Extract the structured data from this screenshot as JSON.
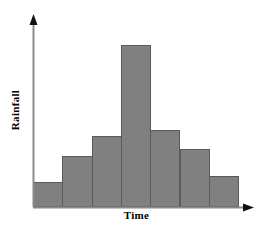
{
  "chart_data": {
    "type": "bar",
    "title": "",
    "subtitle": "",
    "xlabel": "Time",
    "ylabel": "Rainfall",
    "categories": [
      "1",
      "2",
      "3",
      "4",
      "5",
      "6",
      "7"
    ],
    "values": [
      26,
      52,
      73,
      166,
      79,
      60,
      32
    ],
    "ylim": [
      0,
      192
    ],
    "xlim": [
      0,
      7
    ],
    "grid": false,
    "legend": null,
    "legend_position": "none",
    "axis_ticks_x": [],
    "axis_ticks_y": [],
    "annotations": [],
    "bar_fill_color": "#808080",
    "bar_edge_color": "#5a5a5a",
    "axis_color": "#808080",
    "arrow_color": "#000000",
    "background_color": "#ffffff",
    "series": [
      {
        "name": "Rainfall",
        "values": [
          26,
          52,
          73,
          166,
          79,
          60,
          32
        ]
      }
    ]
  },
  "labels": {
    "x_axis": "Time",
    "y_axis": "Rainfall"
  },
  "geometry": {
    "baseline_y": 207,
    "axis_x": 33,
    "bar_width": 29.3,
    "plot_top": 20,
    "plot_right": 238
  }
}
